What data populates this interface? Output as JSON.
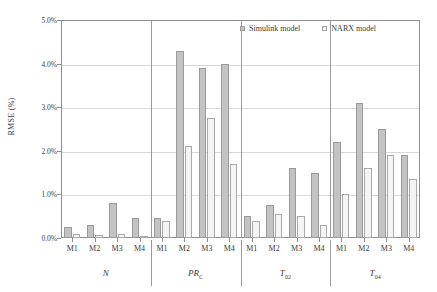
{
  "chart_data": {
    "type": "bar",
    "title": "",
    "xlabel": "",
    "ylabel": "RMSE (%)",
    "ylim": [
      0,
      5
    ],
    "ytick_values": [
      0,
      1,
      2,
      3,
      4,
      5
    ],
    "ytick_labels": [
      "0.0%",
      "1.0%",
      "2.0%",
      "3.0%",
      "4.0%",
      "5.0%"
    ],
    "grid": true,
    "legend_position": "top-right",
    "categories": [
      "M1",
      "M2",
      "M3",
      "M4"
    ],
    "groups": [
      {
        "label": "N",
        "sub": ""
      },
      {
        "label": "PR",
        "sub": "C"
      },
      {
        "label": "T",
        "sub": "02"
      },
      {
        "label": "T",
        "sub": "04"
      }
    ],
    "series": [
      {
        "name": "Simulink model",
        "color": "#c3c3c3",
        "values": [
          [
            0.25,
            0.3,
            0.8,
            0.45
          ],
          [
            0.45,
            4.3,
            3.9,
            4.0
          ],
          [
            0.5,
            0.75,
            1.6,
            1.5
          ],
          [
            2.2,
            3.1,
            2.5,
            1.9
          ]
        ]
      },
      {
        "name": "NARX model",
        "color": "#f4f4f4",
        "values": [
          [
            0.1,
            0.07,
            0.1,
            0.05
          ],
          [
            0.4,
            2.1,
            2.75,
            1.7
          ],
          [
            0.4,
            0.55,
            0.5,
            0.3
          ],
          [
            1.0,
            1.6,
            1.9,
            1.35
          ]
        ]
      }
    ]
  },
  "legend": {
    "items": [
      {
        "label": "Simulink model",
        "marker": "filled-square-icon"
      },
      {
        "label": "NARX model",
        "marker": "open-square-icon"
      }
    ]
  }
}
